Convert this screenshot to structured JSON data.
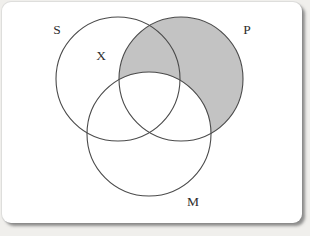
{
  "diagram": {
    "type": "three-circle-venn",
    "circle_labels": {
      "s": "S",
      "p": "P",
      "m": "M"
    },
    "annotation_x": "X",
    "shaded_region": "P outside M (P-only area and the S-P overlap outside M)",
    "colors": {
      "shade_fill": "#c3c3c3",
      "circle_stroke": "#4a4a4a",
      "card_background": "#ffffff",
      "page_background": "#f0efec"
    }
  }
}
